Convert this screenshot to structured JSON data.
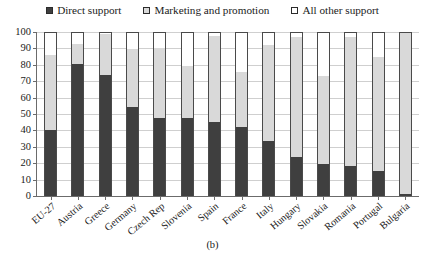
{
  "chart_data": {
    "type": "bar",
    "subtype": "stacked-bar",
    "title": "",
    "caption": "(b)",
    "xlabel": "",
    "ylabel": "",
    "ylim": [
      0,
      100
    ],
    "yticks": [
      0,
      10,
      20,
      30,
      40,
      50,
      60,
      70,
      80,
      90,
      100
    ],
    "grid": true,
    "legend_position": "top-center",
    "stacked_to_100": true,
    "categories": [
      "EU-27",
      "Austria",
      "Greece",
      "Germany",
      "Czech Rep",
      "Slovenia",
      "Spain",
      "France",
      "Italy",
      "Hungary",
      "Slovakia",
      "Romania",
      "Portugal",
      "Bulgaria"
    ],
    "series": [
      {
        "name": "Direct support",
        "color": "#3f3f3f",
        "values": [
          40.5,
          80.5,
          74.0,
          54.5,
          47.5,
          47.5,
          45.0,
          42.0,
          33.5,
          23.5,
          19.5,
          18.5,
          15.0,
          1.5
        ]
      },
      {
        "name": "Marketing and promotion",
        "color": "#d9d9d9",
        "values": [
          45.5,
          12.0,
          24.5,
          35.0,
          42.5,
          31.5,
          52.5,
          33.5,
          58.5,
          73.5,
          53.5,
          78.5,
          70.0,
          98.0
        ]
      },
      {
        "name": "All other support",
        "color": "#ffffff",
        "values": [
          14.0,
          7.5,
          1.5,
          10.5,
          10.0,
          21.0,
          2.5,
          24.5,
          8.0,
          3.0,
          27.0,
          3.0,
          15.0,
          0.5
        ]
      }
    ],
    "cumulative_tops": [
      [
        40.5,
        86.0,
        100
      ],
      [
        80.5,
        92.5,
        100
      ],
      [
        74.0,
        98.5,
        100
      ],
      [
        54.5,
        89.5,
        100
      ],
      [
        47.5,
        90.0,
        100
      ],
      [
        47.5,
        79.0,
        100
      ],
      [
        45.0,
        97.5,
        100
      ],
      [
        42.0,
        75.5,
        100
      ],
      [
        33.5,
        92.0,
        100
      ],
      [
        23.5,
        97.0,
        100
      ],
      [
        19.5,
        73.0,
        100
      ],
      [
        18.5,
        97.0,
        100
      ],
      [
        15.0,
        85.0,
        100
      ],
      [
        1.5,
        99.5,
        100
      ]
    ]
  }
}
